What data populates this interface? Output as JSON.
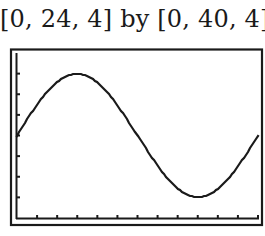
{
  "window_label": "[0, 24, 4] by [0, 40, 4]",
  "colors": {
    "ink": "#1a1a1a",
    "background": "#ffffff"
  },
  "chart_data": {
    "type": "line",
    "title": "[0, 24, 4] by [0, 40, 4]",
    "xlabel": "",
    "ylabel": "",
    "xlim": [
      0,
      24
    ],
    "ylim": [
      0,
      40
    ],
    "xscl": 4,
    "yscl": 4,
    "grid": false,
    "legend": null,
    "series": [
      {
        "name": "y1",
        "x": [
          0,
          1,
          2,
          3,
          4,
          5,
          6,
          7,
          8,
          9,
          10,
          11,
          12,
          13,
          14,
          15,
          16,
          17,
          18,
          19,
          20,
          21,
          22,
          23,
          24
        ],
        "values": [
          20,
          23.9,
          27.5,
          30.6,
          33.0,
          34.5,
          35,
          34.5,
          33.0,
          30.6,
          27.5,
          23.9,
          20,
          16.1,
          12.5,
          9.4,
          7.0,
          5.5,
          5,
          5.5,
          7.0,
          9.4,
          12.5,
          16.1,
          20
        ]
      }
    ],
    "annotations": {
      "max": {
        "x": 6,
        "y": 35
      },
      "min": {
        "x": 18,
        "y": 5
      },
      "midline": 20
    }
  }
}
